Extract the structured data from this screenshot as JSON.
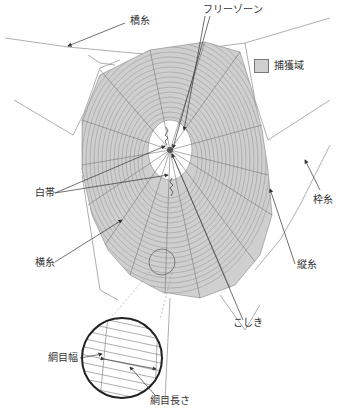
{
  "diagram": {
    "labels": {
      "free_zone": "フリーゾーン",
      "bridge_thread": "橋糸",
      "capture_area": "捕獲域",
      "stabilimentum": "白帯",
      "frame_thread": "枠糸",
      "spiral_thread": "横糸",
      "radial_thread": "縦糸",
      "hub": "こしき",
      "mesh_width": "網目幅",
      "mesh_length": "網目長さ"
    },
    "legend": [
      {
        "swatch_color": "#cfcfcf",
        "label": "捕獲域"
      }
    ],
    "colors": {
      "capture_fill": "#cfcfcf",
      "thread": "#999999",
      "arrow": "#333333",
      "magnifier_ring": "#222222"
    }
  }
}
